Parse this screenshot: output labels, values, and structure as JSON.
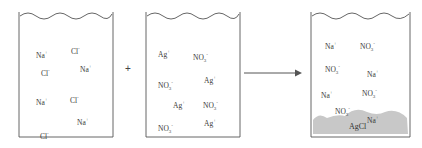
{
  "diagram": {
    "operator": "+",
    "arrow": "reaction-arrow",
    "colors": {
      "line": "#555555",
      "precipitate": "#c8c8c8",
      "text": "#333333"
    },
    "beakers": [
      {
        "name": "sodium-chloride-solution",
        "ions": [
          {
            "base": "Na",
            "charge": "+",
            "x": 17,
            "y": 42
          },
          {
            "base": "Cl",
            "charge": "-",
            "x": 52,
            "y": 38
          },
          {
            "base": "Cl",
            "charge": "-",
            "x": 22,
            "y": 60
          },
          {
            "base": "Na",
            "charge": "+",
            "x": 61,
            "y": 56
          },
          {
            "base": "Na",
            "charge": "+",
            "x": 17,
            "y": 89
          },
          {
            "base": "Cl",
            "charge": "-",
            "x": 51,
            "y": 87
          },
          {
            "base": "Na",
            "charge": "+",
            "x": 58,
            "y": 109
          },
          {
            "base": "Cl",
            "charge": "-",
            "x": 21,
            "y": 123
          }
        ]
      },
      {
        "name": "silver-nitrate-solution",
        "ions": [
          {
            "base": "Ag",
            "charge": "+",
            "x": 12,
            "y": 41
          },
          {
            "base": "NO",
            "sub": "3",
            "charge": "-",
            "x": 47,
            "y": 44
          },
          {
            "base": "NO",
            "sub": "3",
            "charge": "-",
            "x": 12,
            "y": 72
          },
          {
            "base": "Ag",
            "charge": "+",
            "x": 58,
            "y": 67
          },
          {
            "base": "Ag",
            "charge": "+",
            "x": 27,
            "y": 92
          },
          {
            "base": "NO",
            "sub": "3",
            "charge": "-",
            "x": 57,
            "y": 92
          },
          {
            "base": "NO",
            "sub": "3",
            "charge": "-",
            "x": 12,
            "y": 115
          },
          {
            "base": "Ag",
            "charge": "+",
            "x": 58,
            "y": 110
          }
        ]
      },
      {
        "name": "product-mixture",
        "ions": [
          {
            "base": "Na",
            "charge": "+",
            "x": 14,
            "y": 33
          },
          {
            "base": "NO",
            "sub": "3",
            "charge": "-",
            "x": 49,
            "y": 33
          },
          {
            "base": "NO",
            "sub": "3",
            "charge": "-",
            "x": 14,
            "y": 56
          },
          {
            "base": "Na",
            "charge": "+",
            "x": 56,
            "y": 61
          },
          {
            "base": "Na",
            "charge": "+",
            "x": 10,
            "y": 82
          },
          {
            "base": "NO",
            "sub": "3",
            "charge": "-",
            "x": 51,
            "y": 80
          },
          {
            "base": "NO",
            "sub": "3",
            "charge": "-",
            "x": 24,
            "y": 98
          },
          {
            "base": "Na",
            "charge": "+",
            "x": 56,
            "y": 107
          }
        ],
        "precipitate": {
          "label": "AgCl"
        }
      }
    ]
  }
}
